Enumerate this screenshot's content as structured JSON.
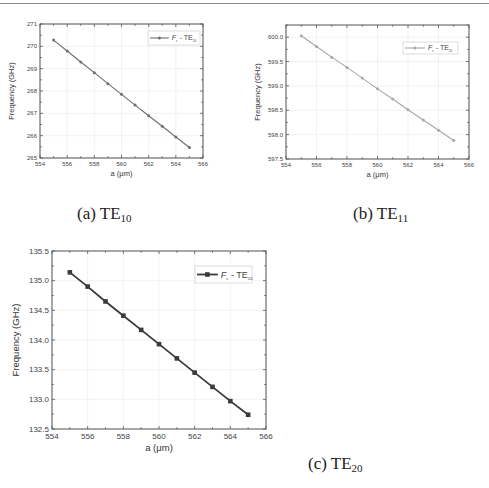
{
  "page": {
    "captions": [
      {
        "prefix": "(a)",
        "mode": "TE",
        "sub": "10"
      },
      {
        "prefix": "(b)",
        "mode": "TE",
        "sub": "11"
      },
      {
        "prefix": "(c)",
        "mode": "TE",
        "sub": "20"
      }
    ]
  },
  "chart_data": [
    {
      "type": "line",
      "title": "",
      "caption": "(a) TE10",
      "xlabel": "a (μm)",
      "ylabel": "Frequency (GHz)",
      "x": [
        555,
        556,
        557,
        558,
        559,
        560,
        561,
        562,
        563,
        564,
        565
      ],
      "series": [
        {
          "name": "Fc - TE10",
          "legend_main": "F",
          "legend_sub1": "c",
          "legend_mid": " - TE",
          "legend_sub2": "10",
          "values": [
            270.28,
            269.79,
            269.3,
            268.82,
            268.33,
            267.85,
            267.37,
            266.89,
            266.42,
            265.94,
            265.47
          ],
          "color": "#6f6f6f",
          "marker": "circle"
        }
      ],
      "xlim": [
        554,
        566
      ],
      "ylim": [
        265,
        271
      ],
      "xticks": [
        "554",
        "556",
        "558",
        "560",
        "562",
        "564",
        "566"
      ],
      "yticks": [
        "265",
        "266",
        "267",
        "268",
        "269",
        "270",
        "271"
      ],
      "grid": true,
      "legend_position": "upper right"
    },
    {
      "type": "line",
      "title": "",
      "caption": "(b) TE11",
      "xlabel": "a (μm)",
      "ylabel": "Frequency (GHz)",
      "x": [
        555,
        556,
        557,
        558,
        559,
        560,
        561,
        562,
        563,
        564,
        565
      ],
      "series": [
        {
          "name": "Fc - TE11",
          "legend_main": "F",
          "legend_sub1": "c",
          "legend_mid": " - TE",
          "legend_sub2": "11",
          "values": [
            600.03,
            599.81,
            599.59,
            599.38,
            599.16,
            598.94,
            598.73,
            598.51,
            598.3,
            598.09,
            597.88
          ],
          "color": "#a8a8a8",
          "marker": "circle"
        }
      ],
      "xlim": [
        554,
        566
      ],
      "ylim": [
        597.5,
        600.25
      ],
      "xticks": [
        "554",
        "556",
        "558",
        "560",
        "562",
        "564",
        "566"
      ],
      "yticks": [
        "597.5",
        "598.0",
        "598.5",
        "599.0",
        "599.5",
        "600.0"
      ],
      "grid": true,
      "legend_position": "upper right"
    },
    {
      "type": "line",
      "title": "",
      "caption": "(c) TE20",
      "xlabel": "a (μm)",
      "ylabel": "Frequency (GHz)",
      "x": [
        555,
        556,
        557,
        558,
        559,
        560,
        561,
        562,
        563,
        564,
        565
      ],
      "series": [
        {
          "name": "Fc - TE20",
          "legend_main": "F",
          "legend_sub1": "c",
          "legend_mid": " - TE",
          "legend_sub2": "20",
          "values": [
            135.14,
            134.9,
            134.65,
            134.41,
            134.17,
            133.93,
            133.69,
            133.45,
            133.21,
            132.97,
            132.74
          ],
          "color": "#3a3a3a",
          "marker": "square"
        }
      ],
      "xlim": [
        554,
        566
      ],
      "ylim": [
        132.5,
        135.5
      ],
      "xticks": [
        "554",
        "556",
        "558",
        "560",
        "562",
        "564",
        "566"
      ],
      "yticks": [
        "132.5",
        "133.0",
        "133.5",
        "134.0",
        "134.5",
        "135.0",
        "135.5"
      ],
      "grid": true,
      "legend_position": "upper right"
    }
  ]
}
